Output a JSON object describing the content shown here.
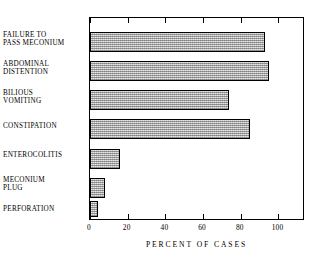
{
  "chart_data": {
    "type": "bar",
    "orientation": "horizontal",
    "title": "",
    "xlabel": "PERCENT OF CASES",
    "ylabel": "",
    "categories": [
      "FAILURE TO\nPASS MECONIUM",
      "ABDOMINAL\nDISTENTION",
      "BILIOUS\nVOMITING",
      "CONSTIPATION",
      "ENTEROCOLITIS",
      "MECONIUM\nPLUG",
      "PERFORATION"
    ],
    "values": [
      93,
      95,
      74,
      85,
      16,
      8,
      4
    ],
    "xlim": [
      0,
      113
    ],
    "xticks": [
      0,
      20,
      40,
      60,
      80,
      100
    ],
    "xticklabels": [
      "0",
      "20",
      "40",
      "60",
      "80",
      "100"
    ],
    "grid": false,
    "legend": false,
    "bar_fill_color": "#c9c9c9",
    "bar_edge_color": "#000000",
    "frame_color": "#000000",
    "background_color": "#ffffff"
  },
  "axis": {
    "x_title": "PERCENT OF CASES"
  }
}
